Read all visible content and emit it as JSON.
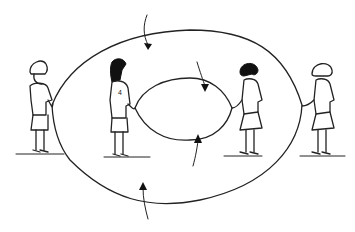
{
  "illustration": {
    "subject": "four children turning two jump ropes",
    "colors": {
      "line": "#222222",
      "background": "#ffffff",
      "hair_dark": "#111111"
    },
    "figures": [
      {
        "id": "child-far-left",
        "hair": "light",
        "shirt_number": ""
      },
      {
        "id": "child-inner-left",
        "hair": "dark-long",
        "shirt_number": "4"
      },
      {
        "id": "child-inner-right",
        "hair": "dark-bob",
        "shirt_number": ""
      },
      {
        "id": "child-far-right",
        "hair": "light",
        "shirt_number": ""
      }
    ],
    "ropes": [
      {
        "id": "outer-rope",
        "shape": "large oval"
      },
      {
        "id": "inner-rope",
        "shape": "small oval"
      }
    ],
    "arrows": [
      {
        "id": "arrow-top-outer",
        "direction": "down"
      },
      {
        "id": "arrow-top-inner",
        "direction": "down"
      },
      {
        "id": "arrow-bottom-inner",
        "direction": "up"
      },
      {
        "id": "arrow-bottom-outer",
        "direction": "up"
      }
    ]
  }
}
